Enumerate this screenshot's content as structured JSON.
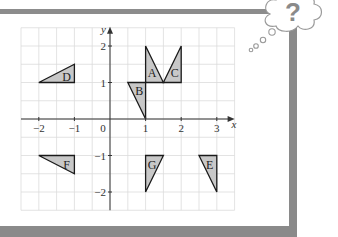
{
  "frame": {
    "border_color": "#8a8a8a",
    "background": "#ffffff"
  },
  "thought_bubble": {
    "symbol": "?",
    "symbol_color": "#8a8a8a"
  },
  "chart_data": {
    "type": "scatter",
    "title": "",
    "xlabel": "x",
    "ylabel": "y",
    "xlim": [
      -2.5,
      3.5
    ],
    "ylim": [
      -2.5,
      2.5
    ],
    "grid": true,
    "grid_step": 0.5,
    "x_ticks": [
      -2,
      -1,
      1,
      2,
      3
    ],
    "x_tick_labels": [
      "−2",
      "−1",
      "1",
      "2",
      "3"
    ],
    "y_ticks": [
      2,
      1,
      -1,
      -2
    ],
    "y_tick_labels": [
      "2",
      "1",
      "−1",
      "−2"
    ],
    "origin_label": "0",
    "shape_fill": "#c8c8c8",
    "shape_stroke": "#1a1a1a",
    "shapes": [
      {
        "label": "A",
        "vertices": [
          [
            1,
            1
          ],
          [
            1,
            2
          ],
          [
            1.5,
            1
          ]
        ],
        "label_pos": [
          1.18,
          1.25
        ]
      },
      {
        "label": "B",
        "vertices": [
          [
            0.5,
            1
          ],
          [
            1,
            1
          ],
          [
            1,
            0
          ]
        ],
        "label_pos": [
          0.82,
          0.78
        ]
      },
      {
        "label": "C",
        "vertices": [
          [
            1.5,
            1
          ],
          [
            2,
            2
          ],
          [
            2,
            1
          ]
        ],
        "label_pos": [
          1.82,
          1.25
        ]
      },
      {
        "label": "D",
        "vertices": [
          [
            -2,
            1
          ],
          [
            -1,
            1.5
          ],
          [
            -1,
            1
          ]
        ],
        "label_pos": [
          -1.22,
          1.15
        ]
      },
      {
        "label": "E",
        "vertices": [
          [
            2.5,
            -1
          ],
          [
            3,
            -1
          ],
          [
            3,
            -2
          ]
        ],
        "label_pos": [
          2.8,
          -1.25
        ]
      },
      {
        "label": "F",
        "vertices": [
          [
            -2,
            -1
          ],
          [
            -1,
            -1
          ],
          [
            -1,
            -1.5
          ]
        ],
        "label_pos": [
          -1.22,
          -1.25
        ]
      },
      {
        "label": "G",
        "vertices": [
          [
            1,
            -1
          ],
          [
            1.5,
            -1
          ],
          [
            1,
            -2
          ]
        ],
        "label_pos": [
          1.18,
          -1.25
        ]
      }
    ]
  }
}
